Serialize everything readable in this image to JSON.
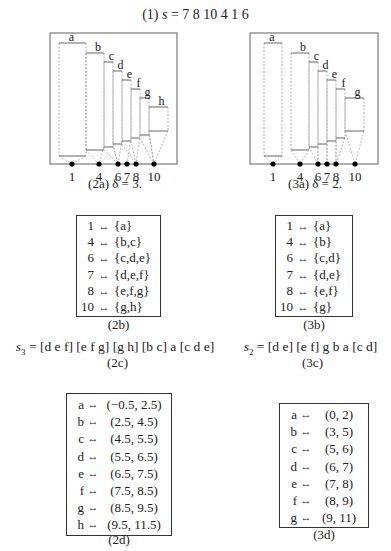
{
  "title": {
    "label": "(1)",
    "var": "s",
    "eq": "=",
    "values": "7 8 10 4 1 6"
  },
  "diagrams": [
    {
      "id": "2a",
      "caption": "(2a) δ = 3.",
      "frame": {
        "x": 50,
        "y": 33,
        "w": 127,
        "h": 131
      },
      "positions": [
        {
          "label": "1",
          "x": 72
        },
        {
          "label": "4",
          "x": 99
        },
        {
          "label": "6",
          "x": 118
        },
        {
          "label": "7",
          "x": 127
        },
        {
          "label": "8",
          "x": 136
        },
        {
          "label": "10",
          "x": 154
        }
      ],
      "boxes": [
        {
          "name": "a",
          "x1": 59,
          "x2": 86,
          "top": 43,
          "bottom": 156,
          "anchor": [
            0
          ]
        },
        {
          "name": "b",
          "x1": 86,
          "x2": 104,
          "top": 53,
          "bottom": 150,
          "anchor": [
            1,
            2
          ]
        },
        {
          "name": "c",
          "x1": 104,
          "x2": 113,
          "top": 62,
          "bottom": 147,
          "anchor": [
            1,
            2
          ]
        },
        {
          "name": "d",
          "x1": 113,
          "x2": 122,
          "top": 71,
          "bottom": 144,
          "anchor": [
            2,
            3,
            4
          ]
        },
        {
          "name": "e",
          "x1": 122,
          "x2": 131,
          "top": 80,
          "bottom": 141,
          "anchor": [
            2,
            3,
            4
          ]
        },
        {
          "name": "f",
          "x1": 131,
          "x2": 140,
          "top": 89,
          "bottom": 138,
          "anchor": [
            3,
            4,
            5
          ]
        },
        {
          "name": "g",
          "x1": 140,
          "x2": 149,
          "top": 98,
          "bottom": 135,
          "anchor": [
            4,
            5
          ]
        },
        {
          "name": "h",
          "x1": 149,
          "x2": 168,
          "top": 107,
          "bottom": 131,
          "anchor": [
            5
          ]
        }
      ]
    },
    {
      "id": "3a",
      "caption": "(3a) δ = 2.",
      "frame": {
        "x": 250,
        "y": 33,
        "w": 128,
        "h": 131
      },
      "positions": [
        {
          "label": "1",
          "x": 273
        },
        {
          "label": "4",
          "x": 300
        },
        {
          "label": "6",
          "x": 318
        },
        {
          "label": "7",
          "x": 327
        },
        {
          "label": "8",
          "x": 336
        },
        {
          "label": "10",
          "x": 355
        }
      ],
      "boxes": [
        {
          "name": "a",
          "x1": 264,
          "x2": 282,
          "top": 43,
          "bottom": 156,
          "anchor": [
            0
          ]
        },
        {
          "name": "b",
          "x1": 291,
          "x2": 309,
          "top": 53,
          "bottom": 150,
          "anchor": [
            1
          ]
        },
        {
          "name": "c",
          "x1": 309,
          "x2": 318,
          "top": 62,
          "bottom": 147,
          "anchor": [
            2
          ]
        },
        {
          "name": "d",
          "x1": 318,
          "x2": 327,
          "top": 71,
          "bottom": 144,
          "anchor": [
            2,
            3
          ]
        },
        {
          "name": "e",
          "x1": 327,
          "x2": 336,
          "top": 80,
          "bottom": 141,
          "anchor": [
            3,
            4
          ]
        },
        {
          "name": "f",
          "x1": 336,
          "x2": 345,
          "top": 89,
          "bottom": 138,
          "anchor": [
            4
          ]
        },
        {
          "name": "g",
          "x1": 345,
          "x2": 364,
          "top": 98,
          "bottom": 131,
          "anchor": [
            5
          ]
        }
      ]
    }
  ],
  "maps": [
    {
      "id": "2b",
      "caption": "(2b)",
      "rows": [
        {
          "key": "1",
          "arrow": "↔",
          "value": "{a}"
        },
        {
          "key": "4",
          "arrow": "↔",
          "value": "{b,c}"
        },
        {
          "key": "6",
          "arrow": "↔",
          "value": "{c,d,e}"
        },
        {
          "key": "7",
          "arrow": "↔",
          "value": "{d,e,f}"
        },
        {
          "key": "8",
          "arrow": "↔",
          "value": "{e,f,g}"
        },
        {
          "key": "10",
          "arrow": "↔",
          "value": "{g,h}"
        }
      ]
    },
    {
      "id": "3b",
      "caption": "(3b)",
      "rows": [
        {
          "key": "1",
          "arrow": "↔",
          "value": "{a}"
        },
        {
          "key": "4",
          "arrow": "↔",
          "value": "{b}"
        },
        {
          "key": "6",
          "arrow": "↔",
          "value": "{c,d}"
        },
        {
          "key": "7",
          "arrow": "↔",
          "value": "{d,e}"
        },
        {
          "key": "8",
          "arrow": "↔",
          "value": "{e,f}"
        },
        {
          "key": "10",
          "arrow": "↔",
          "value": "{g}"
        }
      ]
    }
  ],
  "sequences": [
    {
      "id": "2c",
      "var": "s",
      "sub": "3",
      "expr": "= [d e f] [e f g] [g h] [b c] a [c d e]",
      "caption": "(2c)"
    },
    {
      "id": "3c",
      "var": "s",
      "sub": "2",
      "expr": "= [d e] [e f] g b a [c d]",
      "caption": "(3c)"
    }
  ],
  "intervals": [
    {
      "id": "2d",
      "caption": "(2d)",
      "rows": [
        {
          "key": "a",
          "arrow": "↔",
          "value": "(−0.5, 2.5)"
        },
        {
          "key": "b",
          "arrow": "↔",
          "value": "(2.5, 4.5)"
        },
        {
          "key": "c",
          "arrow": "↔",
          "value": "(4.5, 5.5)"
        },
        {
          "key": "d",
          "arrow": "↔",
          "value": "(5.5, 6.5)"
        },
        {
          "key": "e",
          "arrow": "↔",
          "value": "(6.5, 7.5)"
        },
        {
          "key": "f",
          "arrow": "↔",
          "value": "(7.5, 8.5)"
        },
        {
          "key": "g",
          "arrow": "↔",
          "value": "(8.5, 9.5)"
        },
        {
          "key": "h",
          "arrow": "↔",
          "value": "(9.5, 11.5)"
        }
      ]
    },
    {
      "id": "3d",
      "caption": "(3d)",
      "rows": [
        {
          "key": "a",
          "arrow": "↔",
          "value": "(0, 2)"
        },
        {
          "key": "b",
          "arrow": "↔",
          "value": "(3, 5)"
        },
        {
          "key": "c",
          "arrow": "↔",
          "value": "(5, 6)"
        },
        {
          "key": "d",
          "arrow": "↔",
          "value": "(6, 7)"
        },
        {
          "key": "e",
          "arrow": "↔",
          "value": "(7, 8)"
        },
        {
          "key": "f",
          "arrow": "↔",
          "value": "(8, 9)"
        },
        {
          "key": "g",
          "arrow": "↔",
          "value": "(9, 11)"
        }
      ]
    }
  ],
  "colors": {
    "frame": "#7a7a7a",
    "dashed": "#9a9a9a",
    "solid": "#555555",
    "dot": "#000000",
    "text": "#222222"
  }
}
